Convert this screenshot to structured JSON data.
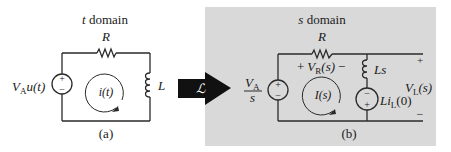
{
  "figure": {
    "panel_a": {
      "title": "t domain",
      "caption": "(a)",
      "resistor_label": "R",
      "inductor_label": "L",
      "source_label_main": "V",
      "source_label_sub": "A",
      "source_label_arg": "u(t)",
      "current_label": "i(t)",
      "source_plus": "+",
      "source_minus": "−"
    },
    "transform": {
      "symbol": "ℒ",
      "arrow_color": "#111111",
      "symbol_color": "#ffffff"
    },
    "panel_b": {
      "title": "s domain",
      "caption": "(b)",
      "background": "#d9d9d9",
      "resistor_label": "R",
      "vr_plus": "+",
      "vr_main": "V",
      "vr_sub": "R",
      "vr_arg": "(s)",
      "vr_minus": "−",
      "source_num_main": "V",
      "source_num_sub": "A",
      "source_den": "s",
      "source_plus": "+",
      "source_minus": "−",
      "current_label": "I(s)",
      "inductor_label": "Ls",
      "ic_source_main": "Li",
      "ic_source_sub": "L",
      "ic_source_arg": "(0)",
      "ic_plus": "+",
      "ic_minus": "−",
      "vl_main": "V",
      "vl_sub": "L",
      "vl_arg": "(s)",
      "vl_plus": "+",
      "vl_minus": "−"
    }
  }
}
